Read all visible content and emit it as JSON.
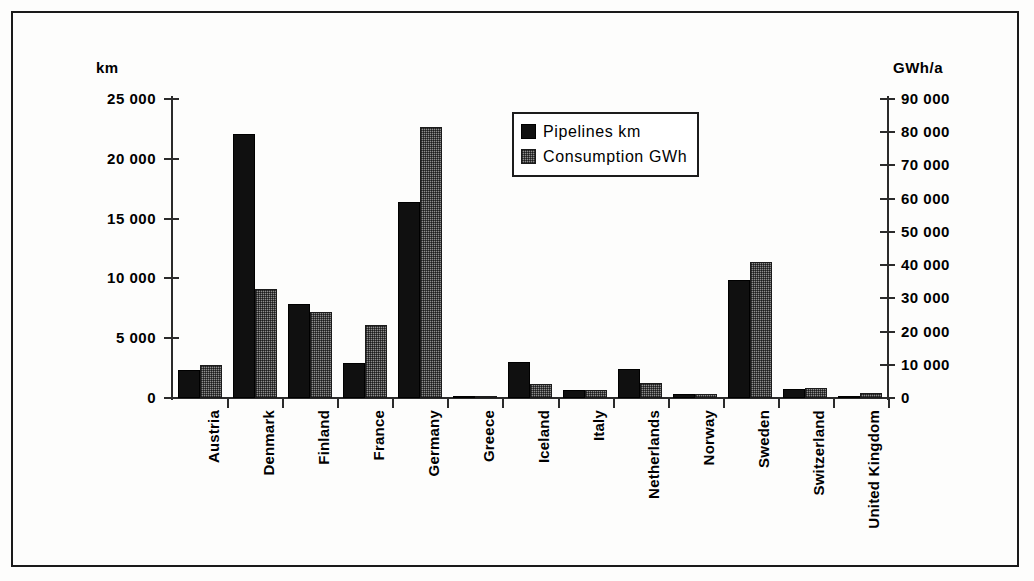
{
  "chart_data": {
    "type": "bar",
    "title": "",
    "subtitle": "",
    "xlabel": "",
    "ylabel": "km",
    "y2label": "GWh/a",
    "grid": false,
    "legend_position": "inside-top-center",
    "ylim": [
      0,
      25000
    ],
    "y2lim": [
      0,
      90000
    ],
    "yticks": [
      "0",
      "5 000",
      "10 000",
      "15 000",
      "20 000",
      "25 000"
    ],
    "ytick_values": [
      0,
      5000,
      10000,
      15000,
      20000,
      25000
    ],
    "y2ticks": [
      "0",
      "10 000",
      "20 000",
      "30 000",
      "40 000",
      "50 000",
      "60 000",
      "70 000",
      "80 000",
      "90 000"
    ],
    "y2tick_values": [
      0,
      10000,
      20000,
      30000,
      40000,
      50000,
      60000,
      70000,
      80000,
      90000
    ],
    "categories": [
      "Austria",
      "Denmark",
      "Finland",
      "France",
      "Germany",
      "Greece",
      "Iceland",
      "Italy",
      "Netherlands",
      "Norway",
      "Sweden",
      "Switzerland",
      "United Kingdom"
    ],
    "series": [
      {
        "name": "Pipelines km",
        "axis": "left",
        "unit": "km",
        "color": "#101010",
        "values": [
          2350,
          22050,
          7850,
          2900,
          16350,
          80,
          3050,
          700,
          2400,
          350,
          9850,
          750,
          60
        ]
      },
      {
        "name": "Consumption GWh",
        "axis": "right",
        "unit": "GWh",
        "color": "#8d8d8d",
        "values": [
          10000,
          32700,
          26000,
          22100,
          81500,
          300,
          4100,
          2400,
          4500,
          1100,
          41000,
          2900,
          1400
        ]
      }
    ]
  },
  "legend": {
    "items": [
      {
        "label": "Pipelines km",
        "swatch": "black-solid"
      },
      {
        "label": "Consumption GWh",
        "swatch": "gray-hatched"
      }
    ]
  },
  "axes": {
    "left_unit": "km",
    "right_unit": "GWh/a"
  }
}
